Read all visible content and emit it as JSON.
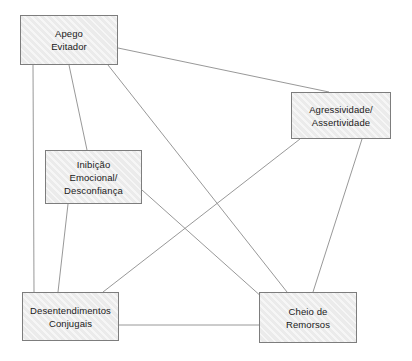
{
  "diagram": {
    "background_color": "#ffffff",
    "node_fill_color": "#ebebeb",
    "node_border_color": "#7d7d7d",
    "edge_color": "#8c8c8c",
    "text_color": "#1a1a1a",
    "nodes": [
      {
        "id": "apego-evitador",
        "label": "Apego Evitador",
        "lines": [
          "Apego",
          "Evitador"
        ],
        "x": 20,
        "y": 15,
        "width": 98,
        "height": 50
      },
      {
        "id": "agressividade-assertividade",
        "label": "Agressividade/ Assertividade",
        "lines": [
          "Agressividade/",
          "Assertividade"
        ],
        "x": 291,
        "y": 92,
        "width": 100,
        "height": 47
      },
      {
        "id": "inibicao-emocional-desconfianca",
        "label": "Inibição Emocional/ Desconfiança",
        "lines": [
          "Inibição",
          "Emocional/",
          "Desconfiança"
        ],
        "x": 45,
        "y": 150,
        "width": 97,
        "height": 54
      },
      {
        "id": "desentendimentos-conjugais",
        "label": "Desentendimentos Conjugais",
        "lines": [
          "Desentendimentos",
          "Conjugais"
        ],
        "x": 22,
        "y": 292,
        "width": 97,
        "height": 49
      },
      {
        "id": "cheio-de-remorsos",
        "label": "Cheio de Remorsos",
        "lines": [
          "Cheio de",
          "Remorsos"
        ],
        "x": 259,
        "y": 292,
        "width": 98,
        "height": 51
      }
    ],
    "edges": [
      {
        "id": "edge-apego-agressividade",
        "from": "apego-evitador",
        "to": "agressividade-assertividade",
        "x1": 118,
        "y1": 48,
        "x2": 329,
        "y2": 92
      },
      {
        "id": "edge-apego-desentendimentos",
        "from": "apego-evitador",
        "to": "desentendimentos-conjugais",
        "x1": 33,
        "y1": 65,
        "x2": 34,
        "y2": 292
      },
      {
        "id": "edge-apego-inibicao",
        "from": "apego-evitador",
        "to": "inibicao-emocional-desconfianca",
        "x1": 69,
        "y1": 65,
        "x2": 87,
        "y2": 150
      },
      {
        "id": "edge-apego-remorsos",
        "from": "apego-evitador",
        "to": "cheio-de-remorsos",
        "x1": 108,
        "y1": 65,
        "x2": 287,
        "y2": 292
      },
      {
        "id": "edge-agressividade-desentendimentos",
        "from": "agressividade-assertividade",
        "to": "desentendimentos-conjugais",
        "x1": 300,
        "y1": 139,
        "x2": 103,
        "y2": 292
      },
      {
        "id": "edge-agressividade-remorsos",
        "from": "agressividade-assertividade",
        "to": "cheio-de-remorsos",
        "x1": 362,
        "y1": 139,
        "x2": 313,
        "y2": 292
      },
      {
        "id": "edge-inibicao-remorsos",
        "from": "inibicao-emocional-desconfianca",
        "to": "cheio-de-remorsos",
        "x1": 142,
        "y1": 190,
        "x2": 263,
        "y2": 298
      },
      {
        "id": "edge-inibicao-desentendimentos",
        "from": "inibicao-emocional-desconfianca",
        "to": "desentendimentos-conjugais",
        "x1": 68,
        "y1": 204,
        "x2": 58,
        "y2": 292
      },
      {
        "id": "edge-desentendimentos-remorsos",
        "from": "desentendimentos-conjugais",
        "to": "cheio-de-remorsos",
        "x1": 119,
        "y1": 325,
        "x2": 259,
        "y2": 325
      }
    ]
  }
}
